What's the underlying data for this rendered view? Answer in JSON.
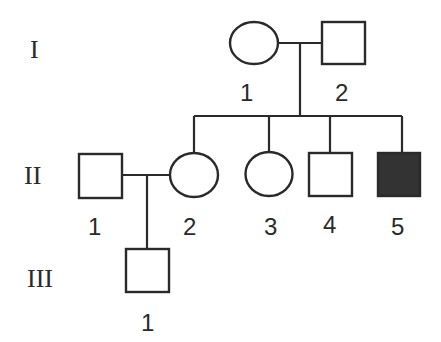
{
  "pedigree": {
    "generations": [
      {
        "label": "I",
        "y": 50
      },
      {
        "label": "II",
        "y": 175
      },
      {
        "label": "III",
        "y": 278
      }
    ],
    "individuals": [
      {
        "id": "I-1",
        "generation": "I",
        "number": "1",
        "sex": "female",
        "affected": false
      },
      {
        "id": "I-2",
        "generation": "I",
        "number": "2",
        "sex": "male",
        "affected": false
      },
      {
        "id": "II-1",
        "generation": "II",
        "number": "1",
        "sex": "male",
        "affected": false
      },
      {
        "id": "II-2",
        "generation": "II",
        "number": "2",
        "sex": "female",
        "affected": false
      },
      {
        "id": "II-3",
        "generation": "II",
        "number": "3",
        "sex": "female",
        "affected": false
      },
      {
        "id": "II-4",
        "generation": "II",
        "number": "4",
        "sex": "male",
        "affected": false
      },
      {
        "id": "II-5",
        "generation": "II",
        "number": "5",
        "sex": "male",
        "affected": true
      },
      {
        "id": "III-1",
        "generation": "III",
        "number": "1",
        "sex": "male",
        "affected": false
      }
    ],
    "matings": [
      {
        "partners": [
          "I-1",
          "I-2"
        ],
        "children": [
          "II-2",
          "II-3",
          "II-4",
          "II-5"
        ]
      },
      {
        "partners": [
          "II-1",
          "II-2"
        ],
        "children": [
          "III-1"
        ]
      }
    ],
    "colors": {
      "line": "#2a2a2a",
      "affected_fill": "#333333",
      "unaffected_fill": "#ffffff"
    }
  }
}
